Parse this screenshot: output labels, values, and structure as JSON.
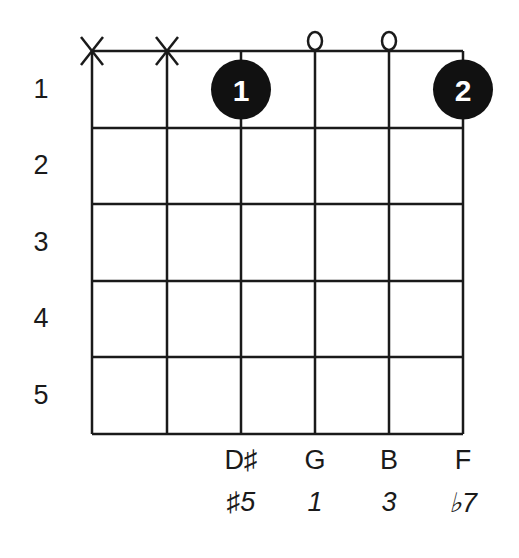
{
  "chord_diagram": {
    "strings_x": [
      92,
      167,
      241,
      315,
      389,
      463
    ],
    "frets_y": [
      51,
      128,
      204,
      281,
      357,
      434
    ],
    "fret_numbers": [
      "1",
      "2",
      "3",
      "4",
      "5"
    ],
    "string_markers": [
      {
        "string": 0,
        "type": "muted",
        "symbol": "X"
      },
      {
        "string": 1,
        "type": "muted",
        "symbol": "X"
      },
      {
        "string": 3,
        "type": "open",
        "symbol": "O"
      },
      {
        "string": 4,
        "type": "open",
        "symbol": "O"
      }
    ],
    "fingers": [
      {
        "string": 2,
        "fret": 1,
        "label": "1"
      },
      {
        "string": 5,
        "fret": 1,
        "label": "2"
      }
    ],
    "notes": [
      {
        "string": 2,
        "note": "D♯",
        "interval": "♯5"
      },
      {
        "string": 3,
        "note": "G",
        "interval": "1"
      },
      {
        "string": 4,
        "note": "B",
        "interval": "3"
      },
      {
        "string": 5,
        "note": "F",
        "interval": "♭7"
      }
    ],
    "colors": {
      "line": "#1a1a1a",
      "dot": "#111111",
      "dot_text": "#ffffff"
    }
  }
}
